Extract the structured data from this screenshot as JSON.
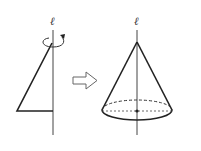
{
  "diagram": {
    "left_figure": {
      "axis_label": "ℓ",
      "shape": "right-triangle",
      "rotation": "counterclockwise-arrow"
    },
    "transition": {
      "icon": "hollow-right-arrow"
    },
    "right_figure": {
      "axis_label": "ℓ",
      "shape": "cone",
      "base": "ellipse with dashed back edge and center point"
    },
    "colors": {
      "stroke": "#222222",
      "arrow_stroke": "#666666",
      "background": "#ffffff"
    }
  }
}
